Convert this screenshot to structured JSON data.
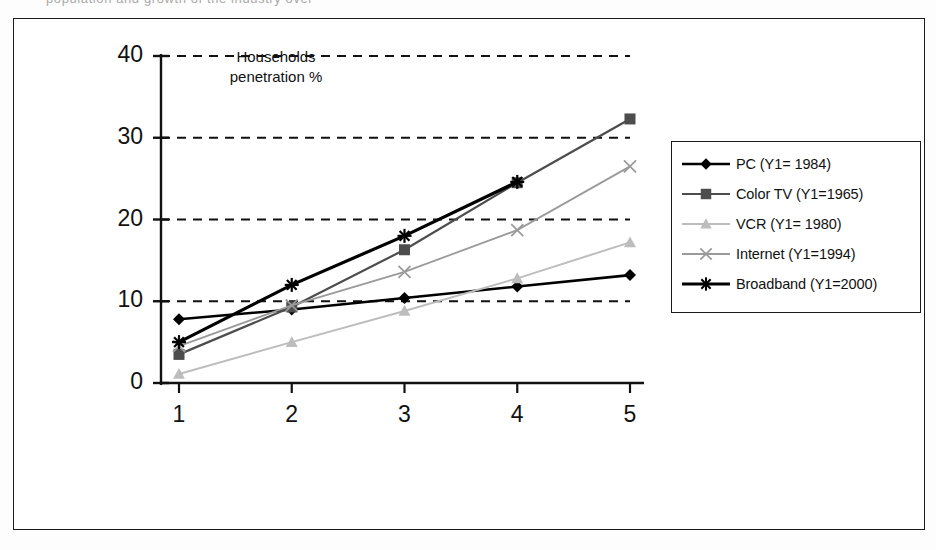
{
  "top_fragment": "population  and  growth  of  the  industry  over",
  "annotation": {
    "line1": "Households",
    "line2": "penetration %"
  },
  "legend": {
    "items": [
      {
        "label": "PC (Y1= 1984)",
        "marker": "diamond-marker",
        "color": "#000000"
      },
      {
        "label": "Color TV (Y1=1965)",
        "marker": "square-marker",
        "color": "#4d4d4d"
      },
      {
        "label": "VCR (Y1= 1980)",
        "marker": "triangle-marker",
        "color": "#bdbdbd"
      },
      {
        "label": "Internet (Y1=1994)",
        "marker": "cross-marker",
        "color": "#9a9a9a"
      },
      {
        "label": "Broadband (Y1=2000)",
        "marker": "star-marker",
        "color": "#000000"
      }
    ]
  },
  "chart_data": {
    "type": "line",
    "title": "",
    "subtitle": "",
    "annotation_text": "Households penetration %",
    "xlabel": "",
    "ylabel": "",
    "categories": [
      "1",
      "2",
      "3",
      "4",
      "5"
    ],
    "xticklabels": [
      "1",
      "2",
      "3",
      "4",
      "5"
    ],
    "yticklabels": [
      "0",
      "10",
      "20",
      "30",
      "40"
    ],
    "ylim": [
      0,
      40
    ],
    "ytick_values": [
      0,
      10,
      20,
      30,
      40
    ],
    "grid": "horizontal-dashed",
    "legend_position": "right",
    "series": [
      {
        "name": "PC (Y1= 1984)",
        "color": "#000000",
        "marker": "diamond",
        "values": [
          7.8,
          9.0,
          10.4,
          11.8,
          13.2
        ]
      },
      {
        "name": "Color TV (Y1=1965)",
        "color": "#4d4d4d",
        "marker": "square",
        "values": [
          3.5,
          9.3,
          16.3,
          24.5,
          32.3
        ]
      },
      {
        "name": "VCR (Y1= 1980)",
        "color": "#bdbdbd",
        "marker": "triangle",
        "values": [
          1.1,
          5.0,
          8.8,
          12.8,
          17.2
        ]
      },
      {
        "name": "Internet (Y1=1994)",
        "color": "#9a9a9a",
        "marker": "cross",
        "values": [
          4.5,
          9.5,
          13.6,
          18.7,
          26.5
        ]
      },
      {
        "name": "Broadband (Y1=2000)",
        "color": "#000000",
        "marker": "star",
        "values": [
          5.0,
          12.0,
          18.0,
          24.6,
          null
        ]
      }
    ]
  }
}
